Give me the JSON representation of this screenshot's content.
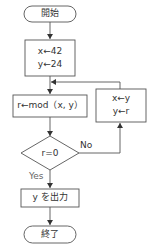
{
  "diagram": {
    "type": "flowchart",
    "nodes": {
      "start": {
        "shape": "terminal",
        "label": "開始"
      },
      "init": {
        "shape": "process",
        "lines": [
          "x←42",
          "y←24"
        ]
      },
      "mod": {
        "shape": "process",
        "label": "r←mod（x,  y）"
      },
      "swap": {
        "shape": "process",
        "lines": [
          "x←y",
          "y←r"
        ]
      },
      "decision": {
        "shape": "decision",
        "label": "r=0"
      },
      "output": {
        "shape": "process",
        "label": "y を出力"
      },
      "end": {
        "shape": "terminal",
        "label": "終了"
      }
    },
    "edges": {
      "no_label": "No",
      "yes_label": "Yes"
    },
    "colors": {
      "stroke": "#555555",
      "text": "#333333",
      "background": "#ffffff"
    }
  }
}
